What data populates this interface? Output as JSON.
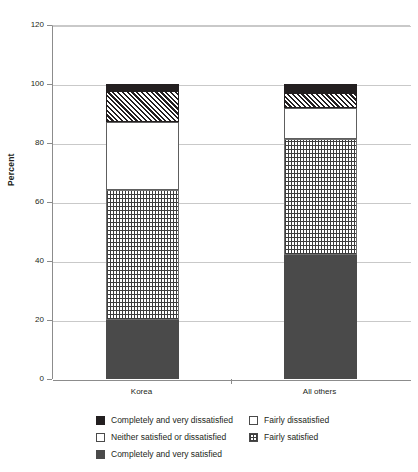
{
  "chart_data": {
    "type": "bar",
    "subtype": "stacked-bar-100",
    "title": "",
    "xlabel": "",
    "ylabel": "Percent",
    "ylim": [
      0,
      120
    ],
    "ytick_labels": [
      "0",
      "20",
      "40",
      "60",
      "80",
      "100",
      "120"
    ],
    "ytick_values": [
      0,
      20,
      40,
      60,
      80,
      100,
      120
    ],
    "grid": true,
    "legend_position": "bottom",
    "categories": [
      "Korea",
      "All others"
    ],
    "stack_order_bottom_to_top": [
      "Completely and very satisfied",
      "Fairly satisfied",
      "Neither satisfied or dissatisfied",
      "Fairly dissatisfied",
      "Completely and very dissatisfied"
    ],
    "series": [
      {
        "name": "Completely and very satisfied",
        "pattern": "solid-dark-grey",
        "color": "#4a4a4a",
        "values": [
          20.0,
          42.0
        ]
      },
      {
        "name": "Fairly satisfied",
        "pattern": "dotted",
        "color": "#ffffff",
        "values": [
          44.0,
          39.5
        ]
      },
      {
        "name": "Neither satisfied or dissatisfied",
        "pattern": "solid-white",
        "color": "#ffffff",
        "values": [
          23.0,
          10.5
        ]
      },
      {
        "name": "Fairly dissatisfied",
        "pattern": "diagonal-hatch",
        "color": "#ffffff",
        "values": [
          10.5,
          5.0
        ]
      },
      {
        "name": "Completely and very dissatisfied",
        "pattern": "solid-black",
        "color": "#231f20",
        "values": [
          2.5,
          3.0
        ]
      }
    ],
    "cumulative_tops": {
      "Korea": [
        20.0,
        64.0,
        87.0,
        97.5,
        100.0
      ],
      "All others": [
        42.0,
        81.5,
        92.0,
        97.0,
        100.0
      ]
    }
  },
  "axes": {
    "y_title": "Percent",
    "y_ticks": [
      {
        "label": "120",
        "value": 120
      },
      {
        "label": "100",
        "value": 100
      },
      {
        "label": "80",
        "value": 80
      },
      {
        "label": "60",
        "value": 60
      },
      {
        "label": "40",
        "value": 40
      },
      {
        "label": "20",
        "value": 20
      },
      {
        "label": "0",
        "value": 0
      }
    ],
    "x_ticks": [
      {
        "label": "Korea"
      },
      {
        "label": "All others"
      }
    ]
  },
  "legend": {
    "left_column": [
      {
        "label": "Completely and very dissatisfied",
        "swatch": "black-square-icon"
      },
      {
        "label": "Neither satisfied or dissatisfied",
        "swatch": "white-square-icon"
      },
      {
        "label": "Completely and very satisfied",
        "swatch": "dark-grey-square-icon"
      }
    ],
    "right_column": [
      {
        "label": "Fairly dissatisfied",
        "swatch": "diagonal-hatch-square-icon"
      },
      {
        "label": "Fairly satisfied",
        "swatch": "dotted-square-icon"
      }
    ]
  },
  "colors": {
    "black": "#231f20",
    "dark_grey": "#4a4a4a",
    "white": "#ffffff",
    "gridline": "#c9c9c9",
    "axis": "#8c8c8c"
  }
}
